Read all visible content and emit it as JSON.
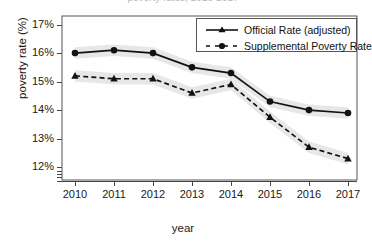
{
  "figure": {
    "title_clipped": "poverty rates, 2010-2017",
    "axes": {
      "xlabel": "year",
      "ylabel": "poverty rate (%)",
      "ytick_labels": [
        "17%",
        "16%",
        "15%",
        "14%",
        "13%",
        "12%"
      ],
      "xtick_labels": [
        "2010",
        "2011",
        "2012",
        "2013",
        "2014",
        "2015",
        "2016",
        "2017"
      ]
    },
    "legend": {
      "entries": [
        {
          "label": "Official Rate (adjusted)",
          "style": "solid",
          "marker": "triangle"
        },
        {
          "label": "Supplemental Poverty Rate",
          "style": "dashed",
          "marker": "circle"
        }
      ]
    }
  },
  "chart_data": {
    "type": "line",
    "title": "poverty rates, 2010-2017",
    "xlabel": "year",
    "ylabel": "poverty rate (%)",
    "x": [
      2010,
      2011,
      2012,
      2013,
      2014,
      2015,
      2016,
      2017
    ],
    "categories": [
      "2010",
      "2011",
      "2012",
      "2013",
      "2014",
      "2015",
      "2016",
      "2017"
    ],
    "xlim": [
      2009.6,
      2017.4
    ],
    "ylim": [
      11.55,
      17.3
    ],
    "yticks": [
      12,
      13,
      14,
      15,
      16,
      17
    ],
    "ytick_labels": [
      "12%",
      "13%",
      "14%",
      "15%",
      "16%",
      "17%"
    ],
    "grid": false,
    "legend_position": "upper right",
    "series": [
      {
        "name": "Official Rate (adjusted)",
        "line_style": "solid",
        "marker": "circle",
        "legend_marker": "triangle",
        "color": "#111111",
        "band_color": "#e3e3e3",
        "values": [
          16.0,
          16.1,
          16.0,
          15.5,
          15.3,
          14.3,
          14.0,
          13.9
        ],
        "band_lower": [
          15.8,
          15.9,
          15.8,
          15.3,
          15.1,
          14.1,
          13.8,
          13.7
        ],
        "band_upper": [
          16.2,
          16.3,
          16.2,
          15.7,
          15.5,
          14.5,
          14.2,
          14.1
        ]
      },
      {
        "name": "Supplemental Poverty Rate",
        "line_style": "dashed",
        "marker": "triangle",
        "legend_marker": "circle",
        "color": "#111111",
        "band_color": "#e3e3e3",
        "values": [
          15.2,
          15.1,
          15.1,
          14.6,
          14.9,
          13.75,
          12.7,
          12.3
        ],
        "band_lower": [
          15.0,
          14.9,
          14.9,
          14.4,
          14.7,
          13.55,
          12.5,
          12.1
        ],
        "band_upper": [
          15.4,
          15.3,
          15.3,
          14.8,
          15.1,
          13.95,
          12.9,
          12.5
        ]
      }
    ]
  }
}
